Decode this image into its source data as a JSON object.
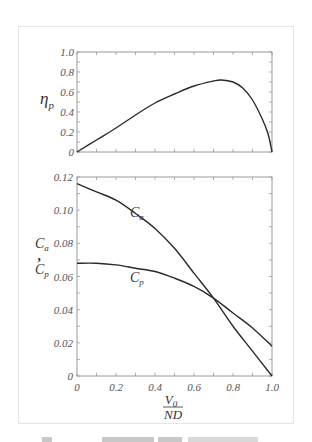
{
  "chart_data": [
    {
      "type": "line",
      "title": "",
      "xlabel": "",
      "ylabel": "η_p",
      "xlim": [
        0,
        1.0
      ],
      "ylim": [
        0,
        1.0
      ],
      "x_ticks": [
        "0",
        "0.2",
        "0.4",
        "0.6",
        "0.8",
        "1.0"
      ],
      "y_ticks": [
        "0",
        "0.2",
        "0.4",
        "0.6",
        "0.8",
        "1.0"
      ],
      "x_tick_labels_shown": false,
      "grid": false,
      "series": [
        {
          "name": "η_p",
          "x": [
            0,
            0.1,
            0.2,
            0.3,
            0.4,
            0.5,
            0.6,
            0.7,
            0.74,
            0.8,
            0.85,
            0.9,
            0.95,
            0.98,
            1.0
          ],
          "values": [
            0,
            0.12,
            0.24,
            0.37,
            0.49,
            0.58,
            0.66,
            0.71,
            0.72,
            0.7,
            0.64,
            0.52,
            0.33,
            0.18,
            0
          ]
        }
      ]
    },
    {
      "type": "line",
      "title": "",
      "xlabel": "V0 / ND",
      "ylabel": "Ca , Cp",
      "xlim": [
        0,
        1.0
      ],
      "ylim": [
        0,
        0.12
      ],
      "x_ticks": [
        "0",
        "0.2",
        "0.4",
        "0.6",
        "0.8",
        "1.0"
      ],
      "y_ticks": [
        "0",
        "0.02",
        "0.04",
        "0.06",
        "0.08",
        "0.10",
        "0.12"
      ],
      "grid": false,
      "annotations": [
        {
          "text": "Ca",
          "x": 0.3,
          "y": 0.098
        },
        {
          "text": "Cp",
          "x": 0.3,
          "y": 0.058
        }
      ],
      "series": [
        {
          "name": "Ca",
          "x": [
            0,
            0.1,
            0.2,
            0.3,
            0.4,
            0.5,
            0.6,
            0.7,
            0.8,
            0.9,
            1.0
          ],
          "values": [
            0.116,
            0.111,
            0.106,
            0.098,
            0.089,
            0.077,
            0.062,
            0.047,
            0.03,
            0.015,
            0
          ]
        },
        {
          "name": "Cp",
          "x": [
            0,
            0.1,
            0.2,
            0.3,
            0.4,
            0.5,
            0.6,
            0.7,
            0.8,
            0.9,
            1.0
          ],
          "values": [
            0.068,
            0.068,
            0.067,
            0.065,
            0.063,
            0.059,
            0.054,
            0.047,
            0.038,
            0.029,
            0.018
          ]
        }
      ]
    }
  ],
  "labels": {
    "top_ylabel_main": "η",
    "top_ylabel_sub": "p",
    "bottom_ylabel_ca_main": "C",
    "bottom_ylabel_ca_sub": "a",
    "bottom_ylabel_sep": ",",
    "bottom_ylabel_cp_main": "C",
    "bottom_ylabel_cp_sub": "p",
    "xlabel_num_main": "V",
    "xlabel_num_sub": "0",
    "xlabel_den": "ND",
    "curve_label_ca_main": "C",
    "curve_label_ca_sub": "a",
    "curve_label_cp_main": "C",
    "curve_label_cp_sub": "p"
  },
  "colors": {
    "curve": "#2a2a2a",
    "axis": "#9a9a9a",
    "tick_label": "#555555",
    "frame": "#e4e4e4"
  }
}
